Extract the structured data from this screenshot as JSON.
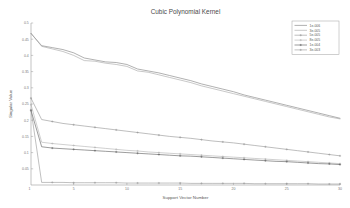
{
  "figure": {
    "background": "#ffffff",
    "plot_background": "#ffffff"
  },
  "chart_data": {
    "type": "line",
    "title": "Cubic Polynomial Kernel",
    "xlabel": "Support Vector Number",
    "ylabel": "Singular Value",
    "xlim": [
      1,
      30
    ],
    "ylim": [
      0,
      0.5
    ],
    "grid": false,
    "legend_position": "top-right",
    "x_ticks": [
      5,
      10,
      15,
      20,
      25,
      30
    ],
    "x_tick_labels": [
      "5",
      "10",
      "15",
      "20",
      "25",
      "30"
    ],
    "y_ticks": [
      0.05,
      0.1,
      0.15,
      0.2,
      0.25,
      0.3,
      0.35,
      0.4,
      0.45,
      0.5
    ],
    "y_tick_labels": [
      "0.05",
      "0.1",
      "0.15",
      "0.2",
      "0.25",
      "0.3",
      "0.35",
      "0.4",
      "0.45",
      "0.5"
    ],
    "x": [
      1,
      2,
      3,
      4,
      5,
      6,
      7,
      8,
      9,
      10,
      11,
      12,
      13,
      14,
      15,
      16,
      17,
      18,
      19,
      20,
      21,
      22,
      23,
      24,
      25,
      26,
      27,
      28,
      29,
      30
    ],
    "series": [
      {
        "name": "1e-006",
        "color": "#707070",
        "marker": "none",
        "values": [
          0.468,
          0.43,
          0.424,
          0.418,
          0.408,
          0.392,
          0.386,
          0.38,
          0.378,
          0.372,
          0.358,
          0.352,
          0.346,
          0.338,
          0.33,
          0.322,
          0.312,
          0.304,
          0.296,
          0.288,
          0.278,
          0.27,
          0.262,
          0.254,
          0.246,
          0.238,
          0.23,
          0.222,
          0.214,
          0.206
        ]
      },
      {
        "name": "3e-005",
        "color": "#9a9a9a",
        "marker": "none",
        "values": [
          0.468,
          0.428,
          0.42,
          0.412,
          0.4,
          0.384,
          0.382,
          0.376,
          0.372,
          0.366,
          0.352,
          0.348,
          0.34,
          0.332,
          0.324,
          0.316,
          0.306,
          0.298,
          0.29,
          0.282,
          0.274,
          0.266,
          0.258,
          0.25,
          0.242,
          0.234,
          0.226,
          0.218,
          0.21,
          0.204
        ]
      },
      {
        "name": "5e-005",
        "color": "#888888",
        "marker": "plus",
        "values": [
          0.268,
          0.202,
          0.196,
          0.19,
          0.186,
          0.182,
          0.178,
          0.174,
          0.17,
          0.166,
          0.162,
          0.158,
          0.154,
          0.15,
          0.147,
          0.144,
          0.14,
          0.136,
          0.133,
          0.13,
          0.126,
          0.122,
          0.118,
          0.114,
          0.11,
          0.106,
          0.102,
          0.098,
          0.094,
          0.09
        ]
      },
      {
        "name": "8e-005",
        "color": "#a8a8a8",
        "marker": "plus",
        "values": [
          0.248,
          0.132,
          0.128,
          0.125,
          0.122,
          0.119,
          0.116,
          0.113,
          0.11,
          0.107,
          0.105,
          0.102,
          0.1,
          0.098,
          0.096,
          0.094,
          0.092,
          0.09,
          0.088,
          0.086,
          0.084,
          0.082,
          0.08,
          0.078,
          0.076,
          0.074,
          0.072,
          0.07,
          0.068,
          0.066
        ]
      },
      {
        "name": "1e-004",
        "color": "#4a4a4a",
        "marker": "plus",
        "values": [
          0.23,
          0.118,
          0.114,
          0.112,
          0.11,
          0.108,
          0.106,
          0.104,
          0.102,
          0.1,
          0.098,
          0.096,
          0.094,
          0.092,
          0.09,
          0.089,
          0.087,
          0.085,
          0.083,
          0.081,
          0.079,
          0.077,
          0.075,
          0.073,
          0.072,
          0.07,
          0.068,
          0.066,
          0.065,
          0.063
        ]
      },
      {
        "name": "3e-003",
        "color": "#8c8c8c",
        "marker": "plus",
        "values": [
          0.232,
          0.008,
          0.008,
          0.008,
          0.007,
          0.007,
          0.007,
          0.007,
          0.007,
          0.006,
          0.006,
          0.006,
          0.006,
          0.006,
          0.006,
          0.005,
          0.005,
          0.005,
          0.005,
          0.005,
          0.005,
          0.004,
          0.004,
          0.004,
          0.004,
          0.004,
          0.004,
          0.003,
          0.003,
          0.003
        ]
      }
    ]
  }
}
